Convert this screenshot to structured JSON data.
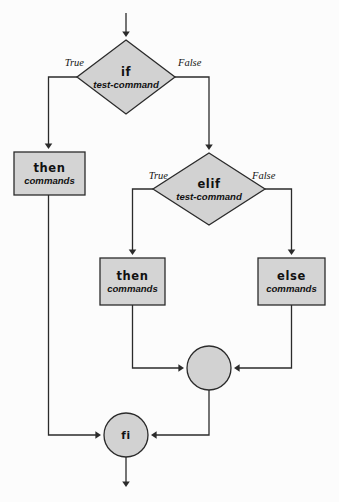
{
  "diagram": {
    "canvas": {
      "width": 339,
      "height": 502
    },
    "colors": {
      "shape_fill": "#d2d2d2",
      "box_fill": "#d4d4d4",
      "stroke": "#2b2b2b",
      "text": "#111111",
      "background": "#fcfcfc"
    },
    "nodes": {
      "if_decision": {
        "keyword": "if",
        "subtitle": "test-command",
        "shape": "diamond",
        "cx": 126,
        "cy": 77,
        "rx": 49,
        "ry": 37
      },
      "elif_decision": {
        "keyword": "elif",
        "subtitle": "test-command",
        "shape": "diamond",
        "cx": 209,
        "cy": 189,
        "rx": 56,
        "ry": 36
      },
      "then_primary": {
        "keyword": "then",
        "subtitle": "commands",
        "shape": "rect",
        "x": 14,
        "y": 152,
        "w": 71,
        "h": 43
      },
      "then_secondary": {
        "keyword": "then",
        "subtitle": "commands",
        "shape": "rect",
        "x": 100,
        "y": 258,
        "w": 65,
        "h": 47
      },
      "else_block": {
        "keyword": "else",
        "subtitle": "commands",
        "shape": "rect",
        "x": 258,
        "y": 258,
        "w": 67,
        "h": 47
      },
      "merge_junction": {
        "keyword": "",
        "shape": "circle",
        "cx": 209,
        "cy": 368,
        "r": 22
      },
      "fi_terminator": {
        "keyword": "fi",
        "shape": "circle",
        "cx": 126,
        "cy": 435,
        "r": 22
      }
    },
    "edge_labels": {
      "if_true": "True",
      "if_false": "False",
      "elif_true": "True",
      "elif_false": "False"
    },
    "edges": [
      {
        "name": "entry-arrow",
        "from": "start",
        "to": "if_decision"
      },
      {
        "name": "if-true-branch",
        "from": "if_decision",
        "to": "then_primary",
        "label": "True"
      },
      {
        "name": "if-false-branch",
        "from": "if_decision",
        "to": "elif_decision",
        "label": "False"
      },
      {
        "name": "elif-true-branch",
        "from": "elif_decision",
        "to": "then_secondary",
        "label": "True"
      },
      {
        "name": "elif-false-branch",
        "from": "elif_decision",
        "to": "else_block",
        "label": "False"
      },
      {
        "name": "then-secondary-to-merge",
        "from": "then_secondary",
        "to": "merge_junction"
      },
      {
        "name": "else-to-merge",
        "from": "else_block",
        "to": "merge_junction"
      },
      {
        "name": "merge-to-fi",
        "from": "merge_junction",
        "to": "fi_terminator"
      },
      {
        "name": "then-primary-to-fi",
        "from": "then_primary",
        "to": "fi_terminator"
      },
      {
        "name": "exit-arrow",
        "from": "fi_terminator",
        "to": "end"
      }
    ]
  }
}
